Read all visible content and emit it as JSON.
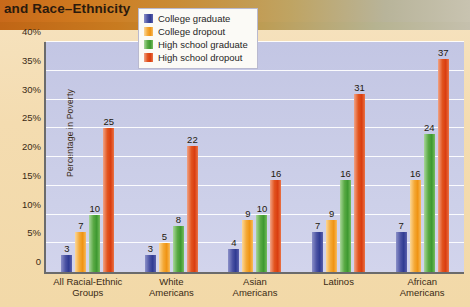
{
  "header": {
    "title": "and Race–Ethnicity"
  },
  "chart_data": {
    "type": "bar",
    "title": "and Race–Ethnicity",
    "xlabel": "",
    "ylabel": "Percentage in Poverty",
    "ylim": [
      0,
      40
    ],
    "grid": true,
    "legend_position": "top-center",
    "ytick_labels": [
      "0",
      "5%",
      "10%",
      "15%",
      "20%",
      "25%",
      "30%",
      "35%",
      "40%"
    ],
    "ytick_values": [
      0,
      5,
      10,
      15,
      20,
      25,
      30,
      35,
      40
    ],
    "categories": [
      "All Racial-Ethnic Groups",
      "White Americans",
      "Asian Americans",
      "Latinos",
      "African Americans"
    ],
    "category_lines": [
      [
        "All Racial-Ethnic",
        "Groups"
      ],
      [
        "White",
        "Americans"
      ],
      [
        "Asian",
        "Americans"
      ],
      [
        "Latinos",
        ""
      ],
      [
        "African",
        "Americans"
      ]
    ],
    "series": [
      {
        "name": "College graduate",
        "color": "#3b44a0",
        "values": [
          3,
          3,
          4,
          7,
          7
        ]
      },
      {
        "name": "College dropout",
        "color": "#f0a030",
        "values": [
          7,
          5,
          9,
          9,
          16
        ]
      },
      {
        "name": "High school graduate",
        "color": "#4da33c",
        "values": [
          10,
          8,
          10,
          16,
          24
        ]
      },
      {
        "name": "High school dropout",
        "color": "#de4a17",
        "values": [
          25,
          22,
          16,
          31,
          37
        ]
      }
    ]
  },
  "legend": {
    "items": [
      {
        "label": "College graduate"
      },
      {
        "label": "College dropout"
      },
      {
        "label": "High school graduate"
      },
      {
        "label": "High school dropout"
      }
    ]
  }
}
